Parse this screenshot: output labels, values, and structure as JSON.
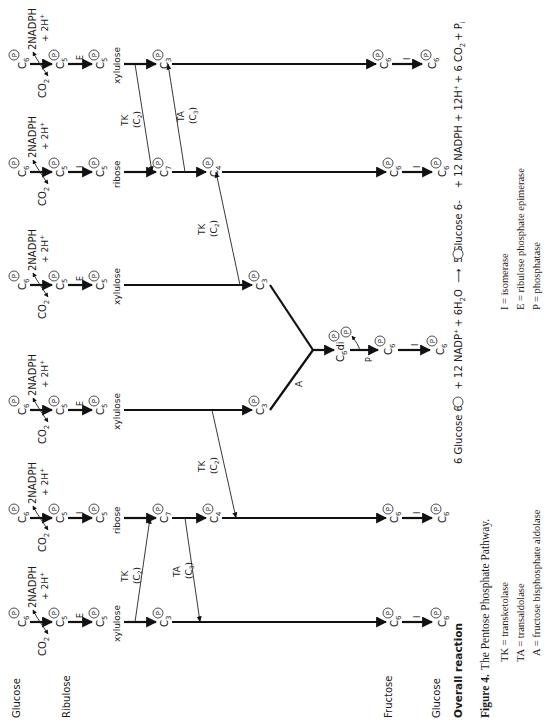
{
  "figure": {
    "row_labels": {
      "glucose_top": "Glucose",
      "ribulose": "Ribulose",
      "fructose": "Fructose",
      "glucose_bottom": "Glucose"
    },
    "species": {
      "c6p": "C",
      "c6_sub": "6",
      "c5_sub": "5",
      "c7_sub": "7",
      "c4_sub": "4",
      "c3_sub": "3",
      "phosphate": "P",
      "di": "di",
      "co2": "CO",
      "co2_sub": "2",
      "nadph": "2NADPH",
      "plus_2h": "+ 2H",
      "plus_sup": "+",
      "ribose": "ribose",
      "xylulose": "xylulose"
    },
    "enzymes": {
      "isomerase": "I",
      "epimerase": "E",
      "transketolase": "TK",
      "transaldolase": "TA",
      "aldolase": "A",
      "phosphatase": "P",
      "c2": "(C",
      "c2_sub": "2",
      "c3": "(C",
      "c3_sub": "3",
      "close": ")"
    },
    "columns": [
      {
        "index": 1,
        "isomer_enzyme": "E",
        "sugar": "xylulose"
      },
      {
        "index": 2,
        "isomer_enzyme": "I",
        "sugar": "ribose"
      },
      {
        "index": 3,
        "isomer_enzyme": "E",
        "sugar": "xylulose"
      },
      {
        "index": 4,
        "isomer_enzyme": "E",
        "sugar": "xylulose"
      },
      {
        "index": 5,
        "isomer_enzyme": "I",
        "sugar": "ribose"
      },
      {
        "index": 6,
        "isomer_enzyme": "E",
        "sugar": "xylulose"
      }
    ],
    "overall_reaction": {
      "label": "Overall reaction",
      "lhs": "6 Glucose 6-",
      "lhs_rest": "+ 12 NADP",
      "lhs_rest2": "+ 6H",
      "lhs_h2o_sub": "2",
      "lhs_o": "O",
      "arrow": "⟶",
      "rhs": "5 Glucose 6-",
      "rhs_rest": "+ 12 NADPH + 12H",
      "rhs_rest2": "+ 6 CO",
      "rhs_co2_sub": "2",
      "rhs_pi": "+ P",
      "rhs_pi_sub": "i"
    },
    "caption": {
      "bold": "Figure 4.",
      "text": "The Pentose Phosphate Pathway."
    },
    "legend_left": [
      "TK = transketolase",
      "TA = transaldolase",
      "A = fructose bisphosphate aldolase"
    ],
    "legend_right": [
      "I = isomerase",
      "E = ribulose phosphate epimerase",
      "P = phosphatase"
    ]
  }
}
